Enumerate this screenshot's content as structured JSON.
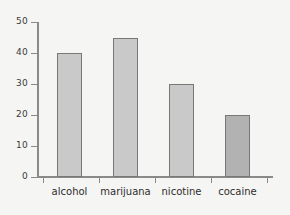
{
  "chart_data": {
    "type": "bar",
    "title": "",
    "subtitle": "",
    "xlabel": "",
    "ylabel": "",
    "categories": [
      "alcohol",
      "marijuana",
      "nicotine",
      "cocaine"
    ],
    "values": [
      40,
      45,
      30,
      20
    ],
    "ylim": [
      0,
      50
    ],
    "yticks": [
      0,
      10,
      20,
      30,
      40,
      50
    ],
    "ytick_labels": [
      "0",
      "10",
      "20",
      "30",
      "40",
      "50"
    ],
    "grid": false,
    "legend": null,
    "annotations": [],
    "bar_colors": [
      "#c9c9c9",
      "#c9c9c9",
      "#c9c9c9",
      "#b2b2b2"
    ],
    "bar_border_color": "#787878",
    "axis_color": "#8a8a8a",
    "background_color": "#f5f5f3",
    "text_color": "#2e2e2e"
  }
}
